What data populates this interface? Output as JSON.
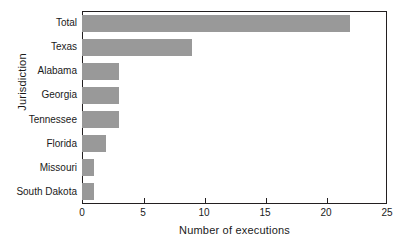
{
  "chart_data": {
    "type": "bar",
    "orientation": "horizontal",
    "title": "",
    "xlabel": "Number of executions",
    "ylabel": "Jurisdiction",
    "categories": [
      "Total",
      "Texas",
      "Alabama",
      "Georgia",
      "Tennessee",
      "Florida",
      "Missouri",
      "South Dakota"
    ],
    "values": [
      22,
      9,
      3,
      3,
      3,
      2,
      1,
      1
    ],
    "xlim": [
      0,
      25
    ],
    "xticks": [
      0,
      5,
      10,
      15,
      20,
      25
    ],
    "xtick_labels": [
      "0",
      "5",
      "10",
      "15",
      "20",
      "25"
    ],
    "grid": false,
    "legend": false,
    "bar_color": "#999999",
    "axis_color": "#231f20",
    "background_color": "#ffffff"
  }
}
